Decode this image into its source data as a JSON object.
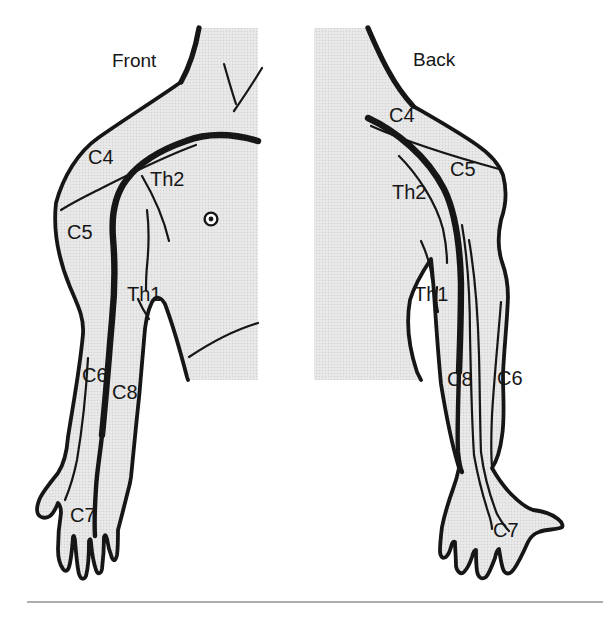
{
  "figure": {
    "views": [
      {
        "title": "Front",
        "labels": [
          "C4",
          "Th2",
          "C5",
          "Th1",
          "C6",
          "C8",
          "C7"
        ]
      },
      {
        "title": "Back",
        "labels": [
          "C4",
          "C5",
          "Th2",
          "Th1",
          "C8",
          "C6",
          "C7"
        ]
      }
    ]
  },
  "colors": {
    "background": "#ffffff",
    "ink": "#161616",
    "body_fill": "#e9e9e9",
    "halftone_dot": "#d3d3d3",
    "divider": "#9b9b9b"
  }
}
